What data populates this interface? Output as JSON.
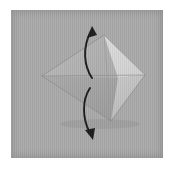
{
  "figure": {
    "canvas": {
      "width": 174,
      "height": 169
    },
    "background_color": "#ffffff"
  },
  "photo": {
    "name": "photo-area",
    "x": 11,
    "y": 10,
    "width": 152,
    "height": 148,
    "background_color": "#a9a9a9",
    "border_color": "#9b9b9b"
  },
  "model": {
    "name": "origami-kite-model",
    "vertices": {
      "left_point": [
        42,
        76
      ],
      "top_point": [
        104,
        35
      ],
      "right_point": [
        145,
        75
      ],
      "bottom_point": [
        111,
        121
      ],
      "center_right": [
        118,
        78
      ]
    },
    "facets": [
      {
        "name": "upper-left-facet",
        "points": "42,76 104,35 118,78",
        "fill": "#b4b4b4"
      },
      {
        "name": "lower-left-facet",
        "points": "42,76 118,78 111,121",
        "fill": "#a2a2a2"
      },
      {
        "name": "upper-right-facet",
        "points": "104,35 145,75 118,78",
        "fill": "#d4d4d4"
      },
      {
        "name": "lower-right-facet",
        "points": "118,78 145,75 111,121",
        "fill": "#c2c2c2"
      }
    ],
    "crease_lines": [
      {
        "name": "horizontal-center-crease",
        "from": [
          42,
          76
        ],
        "to": [
          145,
          75
        ],
        "color": "#8e8e8e"
      },
      {
        "name": "top-left-edge",
        "from": [
          42,
          76
        ],
        "to": [
          104,
          35
        ],
        "color": "#8a8a8a"
      },
      {
        "name": "bottom-left-edge",
        "from": [
          42,
          76
        ],
        "to": [
          111,
          121
        ],
        "color": "#8a8a8a"
      },
      {
        "name": "top-right-edge",
        "from": [
          104,
          35
        ],
        "to": [
          145,
          75
        ],
        "color": "#9a9a9a"
      },
      {
        "name": "bottom-right-edge",
        "from": [
          145,
          75
        ],
        "to": [
          111,
          121
        ],
        "color": "#8a8a8a"
      },
      {
        "name": "vertical-spine-crease",
        "from": [
          104,
          35
        ],
        "to": [
          111,
          121
        ],
        "color": "#9c9c9c"
      }
    ]
  },
  "annotations": {
    "arrows": [
      {
        "name": "upper-fold-arrow",
        "direction": "up",
        "color": "#1a1a1a",
        "path": "M 92,78 C 84,66 82,48 91,31",
        "head_tip": [
          92,
          27
        ],
        "head_points": "92,26 87,38 97,35",
        "meaning": "fold upper flap upward"
      },
      {
        "name": "lower-fold-arrow",
        "direction": "down",
        "color": "#1a1a1a",
        "path": "M 90,88 C 82,100 82,118 90,133",
        "head_tip": [
          92,
          139
        ],
        "head_points": "93,140 85,130 95,128",
        "meaning": "fold lower flap downward"
      }
    ]
  },
  "labels": {
    "step_number": "",
    "caption": ""
  }
}
